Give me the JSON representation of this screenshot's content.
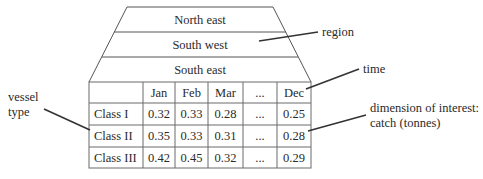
{
  "diagram": {
    "type": "data cube / multidimensional table",
    "layers": [
      "North east",
      "South west",
      "South east"
    ],
    "table": {
      "columns": [
        "",
        "Jan",
        "Feb",
        "Mar",
        "...",
        "Dec"
      ],
      "rows": [
        {
          "label": "Class I",
          "values": [
            "0.32",
            "0.33",
            "0.28",
            "...",
            "0.25"
          ]
        },
        {
          "label": "Class II",
          "values": [
            "0.35",
            "0.33",
            "0.31",
            "...",
            "0.28"
          ]
        },
        {
          "label": "Class III",
          "values": [
            "0.42",
            "0.45",
            "0.32",
            "...",
            "0.29"
          ]
        }
      ]
    },
    "annotations": {
      "region": "region",
      "time": "time",
      "vessel_line1": "vessel",
      "vessel_line2": "type",
      "interest_line1": "dimension of interest:",
      "interest_line2": "catch (tonnes)"
    }
  }
}
